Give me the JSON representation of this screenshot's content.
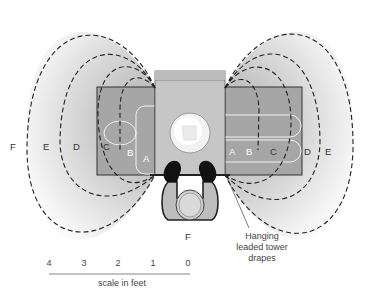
{
  "zones": {
    "left": [
      "F",
      "E",
      "D",
      "C",
      "B",
      "A"
    ],
    "right": [
      "A",
      "B",
      "C",
      "D",
      "E"
    ],
    "bottom": "F"
  },
  "annotation": {
    "line1": "Hanging",
    "line2": "leaded tower",
    "line3": "drapes"
  },
  "scale": {
    "ticks": [
      "4",
      "3",
      "2",
      "1",
      "0"
    ],
    "label": "scale in feet"
  },
  "colors": {
    "table": "#a8a8a8",
    "column": "#c4c4c4",
    "field_dark": "#bdbdbd",
    "field_light": "#ffffff",
    "dash": "#222222"
  }
}
